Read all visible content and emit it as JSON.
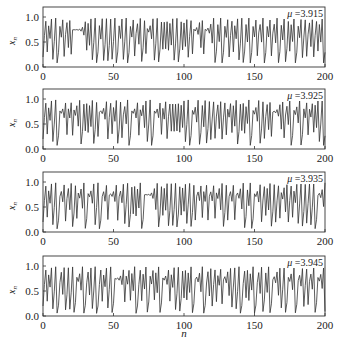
{
  "figure": {
    "xlabel": "n",
    "ylabel_base": "x",
    "ylabel_sub": "n",
    "line_color": "#333333",
    "axis_color": "#333333",
    "mu_prefix": "μ",
    "mu_sep": " =",
    "x_ticks": [
      "0",
      "50",
      "100",
      "150",
      "200"
    ],
    "y_ticks": [
      "0.0",
      "0.5",
      "1.0"
    ]
  },
  "chart_data": [
    {
      "type": "line",
      "title": "μ =3.915",
      "mu": 3.915,
      "x0": 0.2,
      "xlabel": "",
      "ylabel": "x_n",
      "xlim": [
        0,
        200
      ],
      "ylim": [
        0.0,
        1.2
      ],
      "x_ticks": [
        0,
        50,
        100,
        150,
        200
      ],
      "y_ticks": [
        0.0,
        0.5,
        1.0
      ],
      "grid": false,
      "legend": "annotation top-right: μ =3.915",
      "model": "logistic map x_{n+1} = μ x_n (1 - x_n), n = 0..200"
    },
    {
      "type": "line",
      "title": "μ =3.925",
      "mu": 3.925,
      "x0": 0.2,
      "xlabel": "",
      "ylabel": "x_n",
      "xlim": [
        0,
        200
      ],
      "ylim": [
        0.0,
        1.2
      ],
      "x_ticks": [
        0,
        50,
        100,
        150,
        200
      ],
      "y_ticks": [
        0.0,
        0.5,
        1.0
      ],
      "grid": false,
      "legend": "annotation top-right: μ =3.925",
      "model": "logistic map x_{n+1} = μ x_n (1 - x_n), n = 0..200"
    },
    {
      "type": "line",
      "title": "μ =3.935",
      "mu": 3.935,
      "x0": 0.2,
      "xlabel": "",
      "ylabel": "x_n",
      "xlim": [
        0,
        200
      ],
      "ylim": [
        0.0,
        1.2
      ],
      "x_ticks": [
        0,
        50,
        100,
        150,
        200
      ],
      "y_ticks": [
        0.0,
        0.5,
        1.0
      ],
      "grid": false,
      "legend": "annotation top-right: μ =3.935",
      "model": "logistic map x_{n+1} = μ x_n (1 - x_n), n = 0..200"
    },
    {
      "type": "line",
      "title": "μ =3.945",
      "mu": 3.945,
      "x0": 0.2,
      "xlabel": "n",
      "ylabel": "x_n",
      "xlim": [
        0,
        200
      ],
      "ylim": [
        0.0,
        1.2
      ],
      "x_ticks": [
        0,
        50,
        100,
        150,
        200
      ],
      "y_ticks": [
        0.0,
        0.5,
        1.0
      ],
      "grid": false,
      "legend": "annotation top-right: μ =3.945",
      "model": "logistic map x_{n+1} = μ x_n (1 - x_n), n = 0..200"
    }
  ]
}
